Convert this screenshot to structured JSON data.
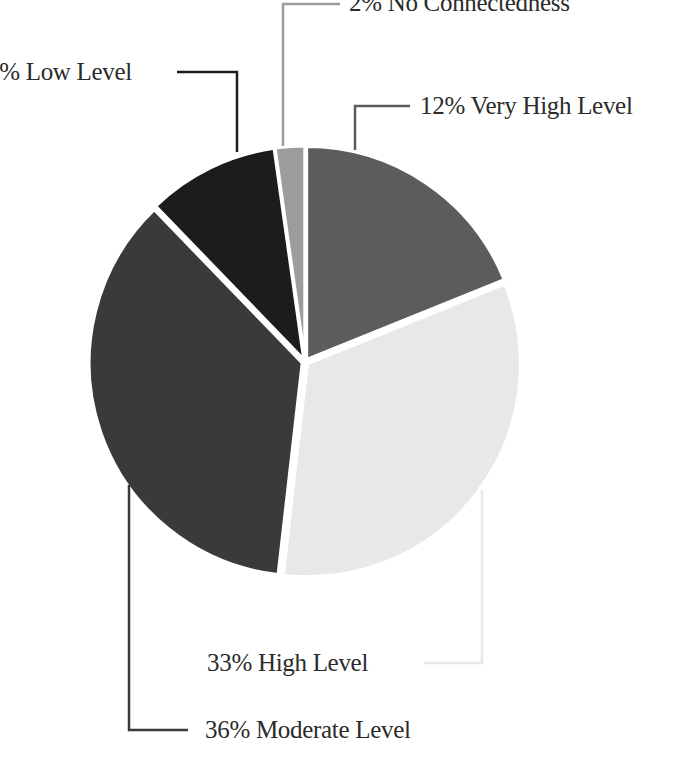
{
  "chart_data": {
    "type": "pie",
    "title": "",
    "slices": [
      {
        "label": "Very High Level",
        "value": 12,
        "display": "12% Very High Level",
        "color": "#5c5c5c"
      },
      {
        "label": "High Level",
        "value": 33,
        "display": "33% High Level",
        "color": "#e8e8e8"
      },
      {
        "label": "Moderate Level",
        "value": 36,
        "display": "36% Moderate Level",
        "color": "#3a3a3a"
      },
      {
        "label": "Low Level",
        "value": 17,
        "display": "% Low Level",
        "color": "#1c1c1c"
      },
      {
        "label": "No Connectedness",
        "value": 2,
        "display": "2% No Connectedness",
        "color": "#9c9c9c"
      }
    ],
    "legend_position": "leader-line labels around pie",
    "start_angle": "12 o'clock, clockwise"
  },
  "labels": {
    "no_connectedness": "2% No Connectedness",
    "low_level": "9% Low Level",
    "very_high_level": "12% Very High Level",
    "high_level": "33% High Level",
    "moderate_level": "36% Moderate Level"
  }
}
